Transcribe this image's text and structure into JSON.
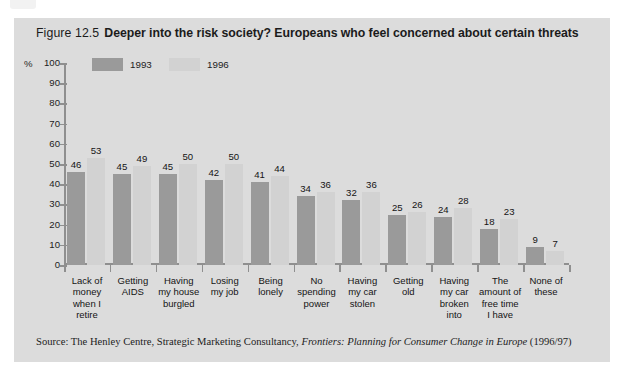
{
  "figure": {
    "number": "Figure 12.5",
    "title": "Deeper into the risk society? Europeans who feel concerned about certain threats",
    "source_prefix": "Source:",
    "source_body": "The Henley Centre, Strategic Marketing Consultancy,",
    "source_italic": "Frontiers: Planning for Consumer Change in Europe",
    "source_suffix": "(1996/97)"
  },
  "colors": {
    "panel": "#dcdcdc",
    "series_1993": "#9a9a9a",
    "series_1996": "#d2d2d2",
    "axis": "#8f8f8f",
    "text": "#1d1d1d"
  },
  "chart_data": {
    "type": "bar",
    "title": "Deeper into the risk society? Europeans who feel concerned about certain threats",
    "xlabel": "",
    "ylabel": "%",
    "ylim": [
      0,
      100
    ],
    "yticks": [
      0,
      10,
      20,
      30,
      40,
      50,
      60,
      70,
      80,
      90,
      100
    ],
    "grid": false,
    "legend_position": "top-left",
    "categories": [
      "Lack of money when I retire",
      "Getting AIDS",
      "Having my house burgled",
      "Losing my job",
      "Being lonely",
      "No spending power",
      "Having my car stolen",
      "Getting old",
      "Having my car broken into",
      "The amount of free time I have",
      "None of these"
    ],
    "category_lines": [
      [
        "Lack of",
        "money",
        "when I",
        "retire"
      ],
      [
        "Getting",
        "AIDS"
      ],
      [
        "Having",
        "my house",
        "burgled"
      ],
      [
        "Losing",
        "my job"
      ],
      [
        "Being",
        "lonely"
      ],
      [
        "No",
        "spending",
        "power"
      ],
      [
        "Having",
        "my car",
        "stolen"
      ],
      [
        "Getting",
        "old"
      ],
      [
        "Having",
        "my car",
        "broken",
        "into"
      ],
      [
        "The",
        "amount of",
        "free time",
        "I have"
      ],
      [
        "None of",
        "these"
      ]
    ],
    "series": [
      {
        "name": "1993",
        "values": [
          46,
          45,
          45,
          42,
          41,
          34,
          32,
          25,
          24,
          18,
          9
        ]
      },
      {
        "name": "1996",
        "values": [
          53,
          49,
          50,
          50,
          44,
          36,
          36,
          26,
          28,
          23,
          7
        ]
      }
    ]
  }
}
